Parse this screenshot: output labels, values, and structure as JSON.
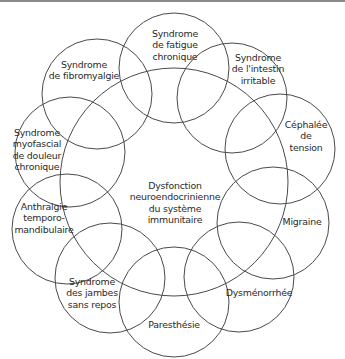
{
  "diagram": {
    "type": "overlapping-circles",
    "stroke_color": "#4a4a4a",
    "center": {
      "label": "Dysfonction\nneuroendocrinienne\ndu système\nimmunitaire",
      "cx": 174,
      "cy": 182,
      "r": 114,
      "label_x": 175,
      "label_y": 203
    },
    "conditions": [
      {
        "id": "fatigue",
        "label": "Syndrome\nde fatigue\nchronique",
        "cx": 174,
        "cy": 68,
        "r": 55,
        "label_x": 175,
        "label_y": 45
      },
      {
        "id": "intestin",
        "label": "Syndrome\nde l'intestin\nirritable",
        "cx": 232,
        "cy": 98,
        "r": 55,
        "label_x": 258,
        "label_y": 69
      },
      {
        "id": "cephalee",
        "label": "Céphalée\nde tension",
        "cx": 280,
        "cy": 149,
        "r": 55,
        "label_x": 306,
        "label_y": 136
      },
      {
        "id": "migraine",
        "label": "Migraine",
        "cx": 273,
        "cy": 223,
        "r": 56,
        "label_x": 302,
        "label_y": 222
      },
      {
        "id": "dysmenorrhee",
        "label": "Dysménorrhée",
        "cx": 239,
        "cy": 277,
        "r": 55,
        "label_x": 259,
        "label_y": 293
      },
      {
        "id": "paresthesie",
        "label": "Paresthésie",
        "cx": 174,
        "cy": 302,
        "r": 55,
        "label_x": 174,
        "label_y": 325
      },
      {
        "id": "jambes",
        "label": "Syndrome\ndes jambes\nsans repos",
        "cx": 110,
        "cy": 278,
        "r": 55,
        "label_x": 92,
        "label_y": 293
      },
      {
        "id": "anthralgie",
        "label": "Anthralgie\ntemporo-\nmandibulaire",
        "cx": 67,
        "cy": 229,
        "r": 55,
        "label_x": 44,
        "label_y": 218
      },
      {
        "id": "myofascial",
        "label": "Syndrome\nmyofascial\nde douleur\nchronique",
        "cx": 70,
        "cy": 152,
        "r": 55,
        "label_x": 37,
        "label_y": 150
      },
      {
        "id": "fibromyalgie",
        "label": "Syndrome\nde fibromyalgie",
        "cx": 97,
        "cy": 94,
        "r": 55,
        "label_x": 84,
        "label_y": 70
      }
    ]
  }
}
